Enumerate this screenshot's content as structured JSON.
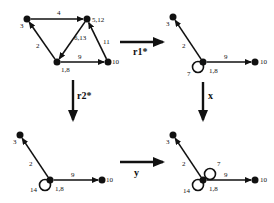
{
  "diagram": {
    "type": "graph-rewriting",
    "graphs": [
      {
        "id": "top-left",
        "nodes": [
          {
            "id": "n3",
            "label": "3",
            "x": 27,
            "y": 19,
            "lx": 20,
            "ly": 28
          },
          {
            "id": "n512",
            "label": "5,12",
            "x": 87,
            "y": 19,
            "lx": 92,
            "ly": 22
          },
          {
            "id": "n18",
            "label": "1,8",
            "x": 57,
            "y": 62,
            "lx": 61,
            "ly": 72
          },
          {
            "id": "n10",
            "label": "10",
            "x": 108,
            "y": 62,
            "lx": 112,
            "ly": 64
          }
        ],
        "edges": [
          {
            "from": "n3",
            "to": "n512",
            "label": "4",
            "lx": 57,
            "ly": 15
          },
          {
            "from": "n18",
            "to": "n3",
            "label": "2",
            "lx": 36,
            "ly": 48
          },
          {
            "from": "n512",
            "to": "n18",
            "label": "6,13",
            "lx": 74,
            "ly": 40
          },
          {
            "from": "n18",
            "to": "n10",
            "label": "9",
            "lx": 78,
            "ly": 59
          },
          {
            "from": "n10",
            "to": "n512",
            "label": "11",
            "lx": 103,
            "ly": 44
          }
        ],
        "loops": []
      },
      {
        "id": "top-right",
        "nodes": [
          {
            "id": "n3",
            "label": "3",
            "x": 173,
            "y": 17,
            "lx": 166,
            "ly": 26
          },
          {
            "id": "n18",
            "label": "1,8",
            "x": 203,
            "y": 62,
            "lx": 209,
            "ly": 73
          },
          {
            "id": "n10",
            "label": "10",
            "x": 255,
            "y": 62,
            "lx": 260,
            "ly": 64
          }
        ],
        "edges": [
          {
            "from": "n18",
            "to": "n3",
            "label": "2",
            "lx": 182,
            "ly": 48
          },
          {
            "from": "n18",
            "to": "n10",
            "label": "9",
            "lx": 224,
            "ly": 59
          }
        ],
        "loops": [
          {
            "node": "n18",
            "label": "7",
            "position": "bottom-left",
            "lx": 187,
            "ly": 76
          }
        ]
      },
      {
        "id": "bottom-left",
        "nodes": [
          {
            "id": "n3",
            "label": "3",
            "x": 20,
            "y": 135,
            "lx": 13,
            "ly": 144
          },
          {
            "id": "n18",
            "label": "1,8",
            "x": 50,
            "y": 180,
            "lx": 55,
            "ly": 191
          },
          {
            "id": "n10",
            "label": "10",
            "x": 102,
            "y": 180,
            "lx": 106,
            "ly": 182
          }
        ],
        "edges": [
          {
            "from": "n18",
            "to": "n3",
            "label": "2",
            "lx": 29,
            "ly": 166
          },
          {
            "from": "n18",
            "to": "n10",
            "label": "9",
            "lx": 71,
            "ly": 177
          }
        ],
        "loops": [
          {
            "node": "n18",
            "label": "14",
            "position": "bottom-left",
            "lx": 30,
            "ly": 192
          }
        ]
      },
      {
        "id": "bottom-right",
        "nodes": [
          {
            "id": "n3",
            "label": "3",
            "x": 173,
            "y": 135,
            "lx": 166,
            "ly": 144
          },
          {
            "id": "n18",
            "label": "1,8",
            "x": 203,
            "y": 180,
            "lx": 209,
            "ly": 191
          },
          {
            "id": "n10",
            "label": "10",
            "x": 255,
            "y": 180,
            "lx": 260,
            "ly": 182
          }
        ],
        "edges": [
          {
            "from": "n18",
            "to": "n3",
            "label": "2",
            "lx": 182,
            "ly": 166
          },
          {
            "from": "n18",
            "to": "n10",
            "label": "9",
            "lx": 224,
            "ly": 177
          }
        ],
        "loops": [
          {
            "node": "n18",
            "label": "7",
            "position": "top-right",
            "lx": 217,
            "ly": 166
          },
          {
            "node": "n18",
            "label": "14",
            "position": "bottom-left",
            "lx": 183,
            "ly": 193
          }
        ]
      }
    ],
    "transitions": [
      {
        "label": "r1*",
        "from": "top-left",
        "to": "top-right",
        "direction": "right",
        "x1": 120,
        "y1": 42,
        "x2": 163,
        "y2": 42,
        "lx": 133,
        "ly": 55
      },
      {
        "label": "r2*",
        "from": "top-left",
        "to": "bottom-left",
        "direction": "down",
        "x1": 73,
        "y1": 80,
        "x2": 73,
        "y2": 120,
        "lx": 77,
        "ly": 99
      },
      {
        "label": "x",
        "from": "top-right",
        "to": "bottom-right",
        "direction": "down",
        "x1": 203,
        "y1": 82,
        "x2": 203,
        "y2": 120,
        "lx": 208,
        "ly": 99
      },
      {
        "label": "y",
        "from": "bottom-left",
        "to": "bottom-right",
        "direction": "right",
        "x1": 120,
        "y1": 162,
        "x2": 163,
        "y2": 162,
        "lx": 134,
        "ly": 176
      }
    ]
  }
}
